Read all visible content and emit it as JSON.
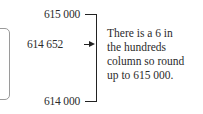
{
  "diagram": {
    "upper_value": "615 000",
    "number": "614 652",
    "lower_value": "614 000",
    "explanation": [
      "There is a 6 in",
      "the hundreds",
      "column so round",
      "up to 615 000."
    ]
  }
}
